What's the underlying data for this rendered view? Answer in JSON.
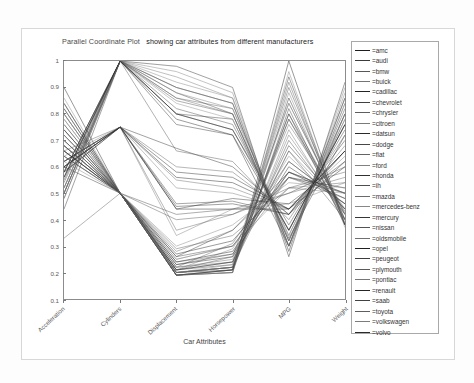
{
  "figure": {
    "title_part1": "Parallel Coordinate Plot",
    "title_part2": "showing car attributes from different manufacturers",
    "title_full": "Parallel Coordinate Plot  showing car attributes from different manufacturers",
    "xaxis_title": "Car Attributes",
    "background": "#ffffff",
    "axis_color": "#8c8c8c",
    "line_color": "#333333"
  },
  "chart_data": {
    "type": "line",
    "subtype": "parallel-coordinates",
    "xlabel": "Car Attributes",
    "ylabel": "",
    "ylim": [
      0.1,
      1.0
    ],
    "grid": false,
    "legend_position": "right",
    "axes": [
      "Acceleration",
      "Cylinders",
      "Displacement",
      "Horsepower",
      "MPG",
      "Weight"
    ],
    "ytick_labels": [
      "0.1",
      "0.2",
      "0.3",
      "0.4",
      "0.5",
      "0.6",
      "0.7",
      "0.8",
      "0.9",
      "1"
    ],
    "ytick_values": [
      0.1,
      0.2,
      0.3,
      0.4,
      0.5,
      0.6,
      0.7,
      0.8,
      0.9,
      1.0
    ],
    "xtick_labels": [
      "Acceleration",
      "Cylinders",
      "Displacement",
      "Horsepower",
      "MPG",
      "Weight"
    ],
    "legend_entries": [
      "=amc",
      "=audi",
      "=bmw",
      "=buick",
      "=cadillac",
      "=chevrolet",
      "=chrysler",
      "=citroen",
      "=datsun",
      "=dodge",
      "=fiat",
      "=ford",
      "=honda",
      "=ih",
      "=mazda",
      "=mercedes-benz",
      "=mercury",
      "=nissan",
      "=oldsmobile",
      "=opel",
      "=peugeot",
      "=plymouth",
      "=pontiac",
      "=renault",
      "=saab",
      "=toyota",
      "=volkswagen",
      "=volvo"
    ],
    "series": [
      {
        "name": "amc",
        "values": [
          0.62,
          0.75,
          0.44,
          0.44,
          0.44,
          0.6
        ]
      },
      {
        "name": "amc",
        "values": [
          0.58,
          0.75,
          0.46,
          0.47,
          0.42,
          0.62
        ]
      },
      {
        "name": "amc",
        "values": [
          0.66,
          0.5,
          0.24,
          0.27,
          0.56,
          0.48
        ]
      },
      {
        "name": "amc",
        "values": [
          0.7,
          0.5,
          0.25,
          0.3,
          0.52,
          0.5
        ]
      },
      {
        "name": "amc",
        "values": [
          0.55,
          1.0,
          0.8,
          0.78,
          0.33,
          0.72
        ]
      },
      {
        "name": "audi",
        "values": [
          0.72,
          0.5,
          0.22,
          0.31,
          0.62,
          0.46
        ]
      },
      {
        "name": "audi",
        "values": [
          0.68,
          0.5,
          0.21,
          0.29,
          0.64,
          0.44
        ]
      },
      {
        "name": "bmw",
        "values": [
          0.6,
          0.5,
          0.26,
          0.36,
          0.58,
          0.5
        ]
      },
      {
        "name": "buick",
        "values": [
          0.5,
          1.0,
          0.86,
          0.82,
          0.34,
          0.8
        ]
      },
      {
        "name": "buick",
        "values": [
          0.52,
          1.0,
          0.92,
          0.86,
          0.3,
          0.84
        ]
      },
      {
        "name": "buick",
        "values": [
          0.6,
          0.75,
          0.67,
          0.6,
          0.42,
          0.7
        ]
      },
      {
        "name": "buick",
        "values": [
          0.64,
          0.5,
          0.4,
          0.42,
          0.52,
          0.58
        ]
      },
      {
        "name": "cadillac",
        "values": [
          0.52,
          1.0,
          0.96,
          0.88,
          0.28,
          0.9
        ]
      },
      {
        "name": "cadillac",
        "values": [
          0.48,
          1.0,
          0.98,
          0.9,
          0.26,
          0.92
        ]
      },
      {
        "name": "chevrolet",
        "values": [
          0.58,
          1.0,
          0.85,
          0.8,
          0.32,
          0.78
        ]
      },
      {
        "name": "chevrolet",
        "values": [
          0.62,
          0.75,
          0.52,
          0.5,
          0.44,
          0.64
        ]
      },
      {
        "name": "chevrolet",
        "values": [
          0.66,
          0.5,
          0.23,
          0.26,
          0.6,
          0.46
        ]
      },
      {
        "name": "chevrolet",
        "values": [
          0.7,
          0.5,
          0.2,
          0.22,
          0.7,
          0.42
        ]
      },
      {
        "name": "chevrolet",
        "values": [
          0.74,
          0.5,
          0.19,
          0.21,
          0.74,
          0.4
        ]
      },
      {
        "name": "chrysler",
        "values": [
          0.5,
          1.0,
          0.9,
          0.84,
          0.3,
          0.86
        ]
      },
      {
        "name": "chrysler",
        "values": [
          0.56,
          1.0,
          0.82,
          0.76,
          0.36,
          0.76
        ]
      },
      {
        "name": "citroen",
        "values": [
          0.78,
          0.5,
          0.22,
          0.24,
          0.66,
          0.44
        ]
      },
      {
        "name": "datsun",
        "values": [
          0.84,
          0.5,
          0.2,
          0.21,
          0.86,
          0.4
        ]
      },
      {
        "name": "datsun",
        "values": [
          0.8,
          0.5,
          0.21,
          0.23,
          0.8,
          0.42
        ]
      },
      {
        "name": "datsun",
        "values": [
          0.76,
          0.5,
          0.22,
          0.25,
          0.76,
          0.44
        ]
      },
      {
        "name": "datsun",
        "values": [
          0.9,
          0.5,
          0.19,
          0.2,
          1.0,
          0.38
        ]
      },
      {
        "name": "dodge",
        "values": [
          0.54,
          1.0,
          0.88,
          0.8,
          0.32,
          0.82
        ]
      },
      {
        "name": "dodge",
        "values": [
          0.6,
          0.75,
          0.55,
          0.52,
          0.44,
          0.66
        ]
      },
      {
        "name": "dodge",
        "values": [
          0.68,
          0.5,
          0.24,
          0.28,
          0.58,
          0.48
        ]
      },
      {
        "name": "fiat",
        "values": [
          0.72,
          0.5,
          0.19,
          0.2,
          0.82,
          0.38
        ]
      },
      {
        "name": "fiat",
        "values": [
          0.66,
          0.5,
          0.2,
          0.22,
          0.78,
          0.4
        ]
      },
      {
        "name": "ford",
        "values": [
          0.52,
          1.0,
          0.84,
          0.78,
          0.34,
          0.78
        ]
      },
      {
        "name": "ford",
        "values": [
          0.58,
          1.0,
          0.8,
          0.74,
          0.38,
          0.74
        ]
      },
      {
        "name": "ford",
        "values": [
          0.62,
          0.75,
          0.6,
          0.58,
          0.42,
          0.68
        ]
      },
      {
        "name": "ford",
        "values": [
          0.7,
          0.5,
          0.25,
          0.3,
          0.56,
          0.5
        ]
      },
      {
        "name": "ford",
        "values": [
          0.74,
          0.5,
          0.21,
          0.24,
          0.68,
          0.44
        ]
      },
      {
        "name": "honda",
        "values": [
          0.82,
          0.5,
          0.19,
          0.21,
          0.92,
          0.38
        ]
      },
      {
        "name": "honda",
        "values": [
          0.78,
          0.5,
          0.2,
          0.22,
          0.88,
          0.39
        ]
      },
      {
        "name": "ih",
        "values": [
          0.44,
          1.0,
          0.76,
          0.72,
          0.3,
          0.8
        ]
      },
      {
        "name": "mazda",
        "values": [
          0.8,
          0.5,
          0.21,
          0.26,
          0.84,
          0.42
        ]
      },
      {
        "name": "mazda",
        "values": [
          0.64,
          0.75,
          0.34,
          0.44,
          0.46,
          0.54
        ]
      },
      {
        "name": "mercedes-benz",
        "values": [
          0.62,
          0.75,
          0.45,
          0.46,
          0.42,
          0.66
        ]
      },
      {
        "name": "mercedes-benz",
        "values": [
          0.56,
          1.0,
          0.66,
          0.62,
          0.4,
          0.72
        ]
      },
      {
        "name": "mercury",
        "values": [
          0.5,
          1.0,
          0.88,
          0.82,
          0.3,
          0.84
        ]
      },
      {
        "name": "mercury",
        "values": [
          0.6,
          0.75,
          0.58,
          0.56,
          0.44,
          0.66
        ]
      },
      {
        "name": "nissan",
        "values": [
          0.84,
          0.5,
          0.2,
          0.22,
          0.9,
          0.4
        ]
      },
      {
        "name": "oldsmobile",
        "values": [
          0.48,
          1.0,
          0.94,
          0.86,
          0.28,
          0.88
        ]
      },
      {
        "name": "oldsmobile",
        "values": [
          0.58,
          1.0,
          0.78,
          0.72,
          0.36,
          0.76
        ]
      },
      {
        "name": "oldsmobile",
        "values": [
          0.64,
          0.5,
          0.42,
          0.44,
          0.5,
          0.6
        ]
      },
      {
        "name": "opel",
        "values": [
          0.72,
          0.5,
          0.2,
          0.22,
          0.72,
          0.42
        ]
      },
      {
        "name": "peugeot",
        "values": [
          0.66,
          0.5,
          0.27,
          0.32,
          0.56,
          0.52
        ]
      },
      {
        "name": "peugeot",
        "values": [
          0.7,
          0.5,
          0.26,
          0.3,
          0.58,
          0.5
        ]
      },
      {
        "name": "plymouth",
        "values": [
          0.52,
          1.0,
          0.86,
          0.8,
          0.32,
          0.8
        ]
      },
      {
        "name": "plymouth",
        "values": [
          0.6,
          0.75,
          0.56,
          0.54,
          0.44,
          0.66
        ]
      },
      {
        "name": "plymouth",
        "values": [
          0.68,
          0.5,
          0.23,
          0.27,
          0.62,
          0.46
        ]
      },
      {
        "name": "pontiac",
        "values": [
          0.5,
          1.0,
          0.9,
          0.84,
          0.3,
          0.86
        ]
      },
      {
        "name": "pontiac",
        "values": [
          0.56,
          1.0,
          0.8,
          0.74,
          0.36,
          0.76
        ]
      },
      {
        "name": "renault",
        "values": [
          0.74,
          0.5,
          0.19,
          0.21,
          0.8,
          0.38
        ]
      },
      {
        "name": "saab",
        "values": [
          0.64,
          0.5,
          0.28,
          0.36,
          0.56,
          0.5
        ]
      },
      {
        "name": "toyota",
        "values": [
          0.8,
          0.5,
          0.2,
          0.23,
          0.84,
          0.42
        ]
      },
      {
        "name": "toyota",
        "values": [
          0.76,
          0.5,
          0.21,
          0.24,
          0.78,
          0.43
        ]
      },
      {
        "name": "toyota",
        "values": [
          0.66,
          0.75,
          0.36,
          0.42,
          0.5,
          0.56
        ]
      },
      {
        "name": "volkswagen",
        "values": [
          0.86,
          0.5,
          0.19,
          0.2,
          0.96,
          0.37
        ]
      },
      {
        "name": "volkswagen",
        "values": [
          0.82,
          0.5,
          0.19,
          0.21,
          0.94,
          0.38
        ]
      },
      {
        "name": "volkswagen",
        "values": [
          0.33,
          0.5,
          0.2,
          0.22,
          0.66,
          0.4
        ]
      },
      {
        "name": "volvo",
        "values": [
          0.62,
          0.5,
          0.3,
          0.38,
          0.54,
          0.52
        ]
      },
      {
        "name": "volvo",
        "values": [
          0.58,
          0.75,
          0.44,
          0.48,
          0.46,
          0.62
        ]
      },
      {
        "name": "volvo",
        "values": [
          0.68,
          0.5,
          0.29,
          0.34,
          0.52,
          0.54
        ]
      }
    ]
  }
}
